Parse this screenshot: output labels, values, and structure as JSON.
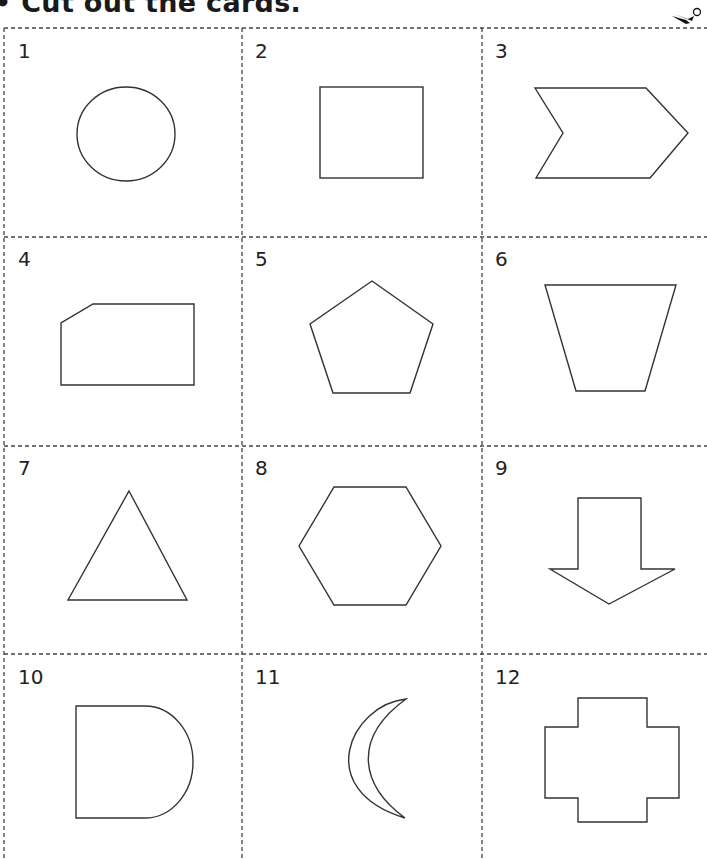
{
  "instruction": "• Cut out the cards.",
  "icons": {
    "scissors": "scissors-icon"
  },
  "colors": {
    "line": "#333333",
    "dash": "#444444",
    "background": "#ffffff"
  },
  "cards": [
    {
      "number": "1",
      "shape": "circle"
    },
    {
      "number": "2",
      "shape": "square"
    },
    {
      "number": "3",
      "shape": "chevron"
    },
    {
      "number": "4",
      "shape": "pentagon-cut-corner-rectangle"
    },
    {
      "number": "5",
      "shape": "pentagon"
    },
    {
      "number": "6",
      "shape": "trapezoid"
    },
    {
      "number": "7",
      "shape": "triangle"
    },
    {
      "number": "8",
      "shape": "hexagon"
    },
    {
      "number": "9",
      "shape": "down-arrow"
    },
    {
      "number": "10",
      "shape": "d-shape"
    },
    {
      "number": "11",
      "shape": "crescent"
    },
    {
      "number": "12",
      "shape": "cross"
    }
  ]
}
